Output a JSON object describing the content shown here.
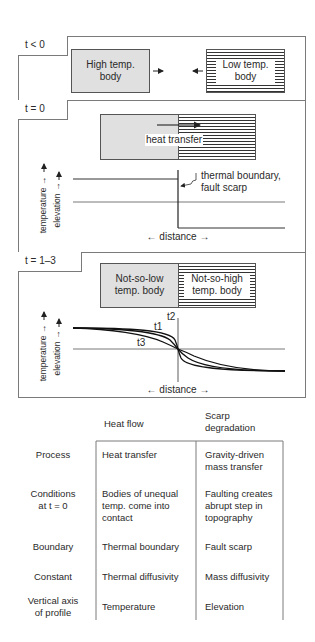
{
  "panels": {
    "t_lt0": {
      "label": "t < 0",
      "high_body": [
        "High temp.",
        "body"
      ],
      "low_body": [
        "Low temp.",
        "body"
      ]
    },
    "t_eq0": {
      "label": "t = 0",
      "arrow_label": "heat transfer",
      "annotation": [
        "thermal boundary,",
        "fault scarp"
      ],
      "y_axis_labels": [
        "temperature →",
        "elevation →"
      ],
      "x_axis_label": "← distance →"
    },
    "t_1_3": {
      "label": "t = 1–3",
      "left_body": [
        "Not-so-low",
        "temp. body"
      ],
      "right_body": [
        "Not-so-high",
        "temp. body"
      ],
      "curve_labels": [
        "t1",
        "t2",
        "t3"
      ],
      "y_axis_labels": [
        "temperature →",
        "elevation →"
      ],
      "x_axis_label": "← distance →"
    }
  },
  "table": {
    "columns": [
      "Heat flow",
      "Scarp degradation"
    ],
    "column_lines": [
      [
        "Heat flow"
      ],
      [
        "Scarp",
        "degradation"
      ]
    ],
    "rows": [
      {
        "label": [
          "Process"
        ],
        "heat": [
          "Heat transfer"
        ],
        "scarp": [
          "Gravity-driven",
          "mass transfer"
        ]
      },
      {
        "label": [
          "Conditions",
          "at t = 0"
        ],
        "heat": [
          "Bodies of unequal",
          "temp. come into",
          "contact"
        ],
        "scarp": [
          "Faulting creates",
          "abrupt step in",
          "topography"
        ]
      },
      {
        "label": [
          "Boundary"
        ],
        "heat": [
          "Thermal boundary"
        ],
        "scarp": [
          "Fault scarp"
        ]
      },
      {
        "label": [
          "Constant"
        ],
        "heat": [
          "Thermal diffusivity"
        ],
        "scarp": [
          "Mass diffusivity"
        ]
      },
      {
        "label": [
          "Vertical axis",
          "of profile"
        ],
        "heat": [
          "Temperature"
        ],
        "scarp": [
          "Elevation"
        ]
      }
    ]
  }
}
